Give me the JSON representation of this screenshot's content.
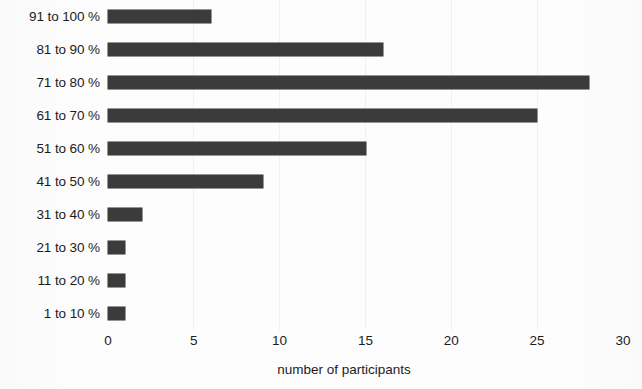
{
  "chart_data": {
    "type": "bar",
    "orientation": "horizontal",
    "title": "",
    "xlabel": "number of participants",
    "ylabel": "",
    "xlim": [
      0,
      30
    ],
    "xticks": [
      "0",
      "5",
      "10",
      "15",
      "20",
      "25",
      "30"
    ],
    "grid": false,
    "legend": null,
    "bar_color": "#3b3b3b",
    "background_color": "#fdfdfd",
    "categories": [
      "91 to 100 %",
      "81 to 90 %",
      "71 to 80 %",
      "61 to 70 %",
      "51 to 60 %",
      "41 to 50 %",
      "31 to 40 %",
      "21 to 30 %",
      "11 to 20 %",
      "1 to 10 %"
    ],
    "values": [
      6,
      16,
      28,
      25,
      15,
      9,
      2,
      1,
      1,
      1
    ]
  }
}
